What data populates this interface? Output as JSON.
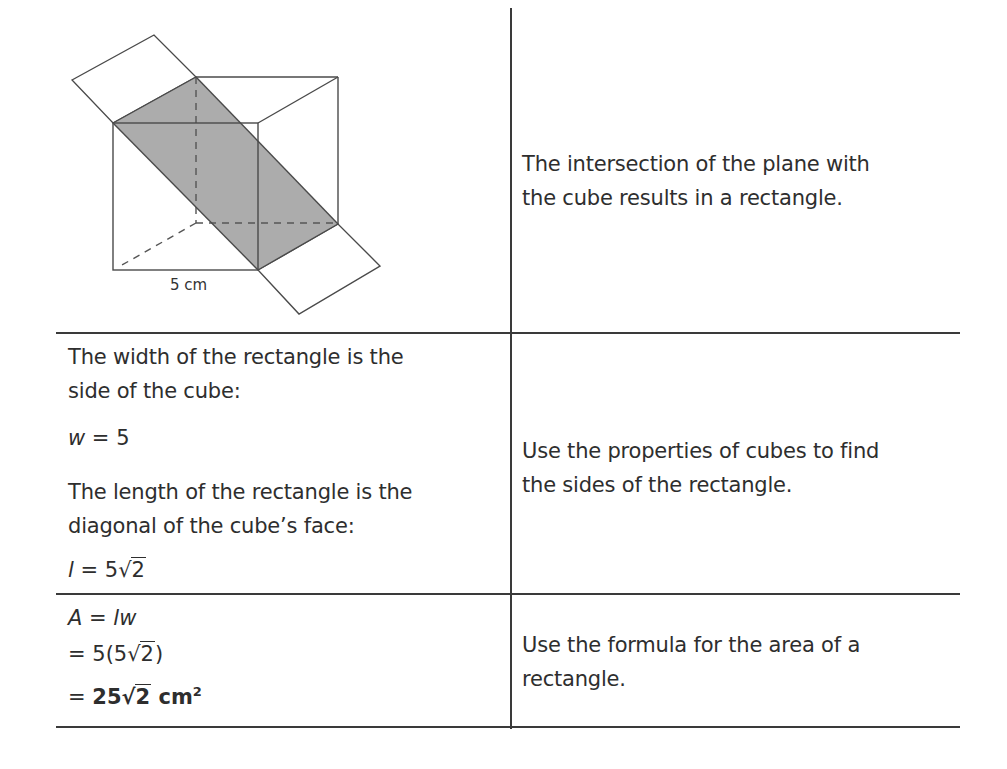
{
  "table": {
    "rows": [
      {
        "left": {
          "type": "figure",
          "figure_label": "5 cm",
          "description": "cube intersected by a diagonal plane forming a shaded rectangle"
        },
        "right": {
          "lines": [
            "The intersection of the plane with",
            "the cube results in a rectangle."
          ]
        }
      },
      {
        "left": {
          "width_text": [
            "The width of the rectangle is the",
            "side of the cube:"
          ],
          "width_eq": {
            "var": "w",
            "op": " = ",
            "value": "5"
          },
          "length_text": [
            "The length of the rectangle is the",
            "diagonal of the cube’s face:"
          ],
          "length_eq": {
            "var": "l",
            "op": " = ",
            "coef": "5",
            "radical": "√",
            "radicand": "2"
          }
        },
        "right": {
          "lines": [
            "Use the properties of cubes to find",
            "the sides of the rectangle."
          ]
        }
      },
      {
        "left": {
          "line1": {
            "var": "A",
            "op": " = ",
            "rhs": "lw"
          },
          "line2": {
            "op": "= ",
            "pre": "5(5",
            "radical": "√",
            "radicand": "2",
            "post": ")"
          },
          "line3": {
            "op": "= ",
            "coef": "25",
            "radical": "√",
            "radicand": "2",
            "unit": " cm",
            "exp": "2"
          }
        },
        "right": {
          "lines": [
            "Use the formula for the area of a",
            "rectangle."
          ]
        }
      }
    ]
  },
  "colors": {
    "shade": "#acacac",
    "line": "#4a4a4a",
    "text": "#2e2e2e"
  }
}
